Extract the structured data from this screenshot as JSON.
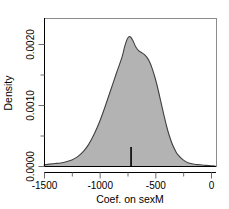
{
  "chart_data": {
    "type": "area",
    "title": "",
    "subtitle": "",
    "xlabel": "Coef. on sexM",
    "ylabel": "Density",
    "xlim": [
      -1600,
      60
    ],
    "ylim": [
      -5e-05,
      0.00245
    ],
    "grid": false,
    "legend": false,
    "legend_position": "none",
    "xticks": [
      -1500,
      -1000,
      -500,
      0
    ],
    "xtick_labels": [
      "-1500",
      "-1000",
      "-500",
      "0"
    ],
    "xminor_ticks": [
      -1250,
      -750,
      -250
    ],
    "yticks": [
      0.0,
      0.001,
      0.002
    ],
    "ytick_labels": [
      "0.0000",
      "0.0010",
      "0.0020"
    ],
    "yminor_ticks": [
      0.0005,
      0.0015
    ],
    "fill_color": "#b3b3b3",
    "line_color": "#404040",
    "series": [
      {
        "name": "Posterior density of Coef. on sexM",
        "x": [
          -1600,
          -1550,
          -1500,
          -1450,
          -1400,
          -1350,
          -1300,
          -1250,
          -1200,
          -1150,
          -1100,
          -1050,
          -1000,
          -950,
          -900,
          -850,
          -800,
          -775,
          -750,
          -725,
          -700,
          -675,
          -650,
          -625,
          -600,
          -575,
          -550,
          -525,
          -500,
          -475,
          -450,
          -425,
          -400,
          -375,
          -350,
          -325,
          -300,
          -250,
          -200,
          -150,
          -100,
          -50,
          0,
          40
        ],
        "y": [
          0.0,
          1e-05,
          2e-05,
          3e-05,
          4e-05,
          5e-05,
          7e-05,
          0.0001,
          0.00015,
          0.00023,
          0.00035,
          0.00052,
          0.00073,
          0.00098,
          0.00125,
          0.00152,
          0.00178,
          0.00196,
          0.00209,
          0.00212,
          0.00205,
          0.00195,
          0.00189,
          0.00186,
          0.00183,
          0.00178,
          0.0017,
          0.00158,
          0.00143,
          0.00125,
          0.00105,
          0.00085,
          0.00066,
          0.0005,
          0.00037,
          0.00027,
          0.00019,
          0.0001,
          5e-05,
          3e-05,
          2e-05,
          1e-05,
          5e-06,
          0.0
        ]
      }
    ],
    "annotations": [
      {
        "name": "observed-estimate-marker",
        "type": "vertical-tick",
        "x": -718,
        "y_from": 0.0,
        "y_to": 0.00028
      }
    ]
  },
  "axes": {
    "y_axis_title": "Density",
    "x_axis_title": "Coef. on sexM"
  }
}
